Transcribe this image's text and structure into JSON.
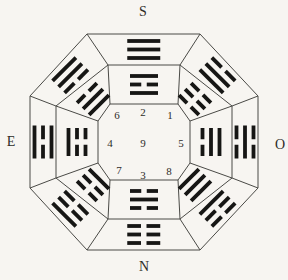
{
  "figure": {
    "type": "bagua-double-octagon-diagram",
    "bg_color": "#f7f5f1",
    "line_color": "#4a4a46",
    "bar_color": "#161614",
    "text_color": "#2e2c28",
    "labels": {
      "top": "S",
      "bottom": "N",
      "left": "E",
      "right": "O"
    },
    "numbers": [
      {
        "value": "6",
        "x": 117,
        "y": 119
      },
      {
        "value": "2",
        "x": 143,
        "y": 116
      },
      {
        "value": "1",
        "x": 170,
        "y": 119
      },
      {
        "value": "4",
        "x": 110,
        "y": 147
      },
      {
        "value": "9",
        "x": 143,
        "y": 147
      },
      {
        "value": "5",
        "x": 181,
        "y": 147
      },
      {
        "value": "7",
        "x": 119,
        "y": 174
      },
      {
        "value": "3",
        "x": 143,
        "y": 179
      },
      {
        "value": "8",
        "x": 169,
        "y": 175
      }
    ],
    "octagons": {
      "outer": [
        [
          87,
          34
        ],
        [
          200,
          34
        ],
        [
          258,
          96
        ],
        [
          258,
          188
        ],
        [
          200,
          250
        ],
        [
          87,
          250
        ],
        [
          30,
          188
        ],
        [
          30,
          96
        ]
      ],
      "middle": [
        [
          108,
          65
        ],
        [
          180,
          65
        ],
        [
          232,
          106
        ],
        [
          232,
          178
        ],
        [
          180,
          219
        ],
        [
          108,
          219
        ],
        [
          56,
          178
        ],
        [
          56,
          106
        ]
      ],
      "inner": [
        [
          110,
          104
        ],
        [
          178,
          104
        ],
        [
          190,
          121
        ],
        [
          190,
          163
        ],
        [
          178,
          180
        ],
        [
          110,
          180
        ],
        [
          98,
          163
        ],
        [
          98,
          121
        ]
      ]
    },
    "trigram": {
      "outer_length": 33,
      "inner_length": 28,
      "thickness": 3.8,
      "pitch": 8.5,
      "break_gap": 5.5
    },
    "outer_ring": [
      {
        "position": "top",
        "trigram": "qian",
        "lines_outer_to_inner": [
          "solid",
          "solid",
          "solid"
        ]
      },
      {
        "position": "top-right",
        "trigram": "xun",
        "lines_outer_to_inner": [
          "broken",
          "solid",
          "solid"
        ]
      },
      {
        "position": "right",
        "trigram": "kan",
        "lines_outer_to_inner": [
          "broken",
          "solid",
          "broken"
        ]
      },
      {
        "position": "bottom-right",
        "trigram": "gen",
        "lines_outer_to_inner": [
          "broken",
          "broken",
          "solid"
        ]
      },
      {
        "position": "bottom",
        "trigram": "kun",
        "lines_outer_to_inner": [
          "broken",
          "broken",
          "broken"
        ]
      },
      {
        "position": "bottom-left",
        "trigram": "zhen",
        "lines_outer_to_inner": [
          "solid",
          "broken",
          "broken"
        ]
      },
      {
        "position": "left",
        "trigram": "li",
        "lines_outer_to_inner": [
          "solid",
          "broken",
          "solid"
        ]
      },
      {
        "position": "top-left",
        "trigram": "dui",
        "lines_outer_to_inner": [
          "solid",
          "solid",
          "broken"
        ]
      }
    ],
    "inner_ring": [
      {
        "position": "top",
        "trigram": "li",
        "lines_outer_to_inner": [
          "solid",
          "broken",
          "solid"
        ]
      },
      {
        "position": "top-right",
        "trigram": "kun",
        "lines_outer_to_inner": [
          "broken",
          "broken",
          "broken"
        ]
      },
      {
        "position": "right",
        "trigram": "dui",
        "lines_outer_to_inner": [
          "solid",
          "solid",
          "broken"
        ]
      },
      {
        "position": "bottom-right",
        "trigram": "qian",
        "lines_outer_to_inner": [
          "solid",
          "solid",
          "solid"
        ]
      },
      {
        "position": "bottom",
        "trigram": "kan",
        "lines_outer_to_inner": [
          "broken",
          "solid",
          "broken"
        ]
      },
      {
        "position": "bottom-left",
        "trigram": "gen",
        "lines_outer_to_inner": [
          "broken",
          "broken",
          "solid"
        ]
      },
      {
        "position": "left",
        "trigram": "zhen",
        "lines_outer_to_inner": [
          "solid",
          "broken",
          "broken"
        ]
      },
      {
        "position": "top-left",
        "trigram": "xun",
        "lines_outer_to_inner": [
          "broken",
          "solid",
          "solid"
        ]
      }
    ]
  }
}
